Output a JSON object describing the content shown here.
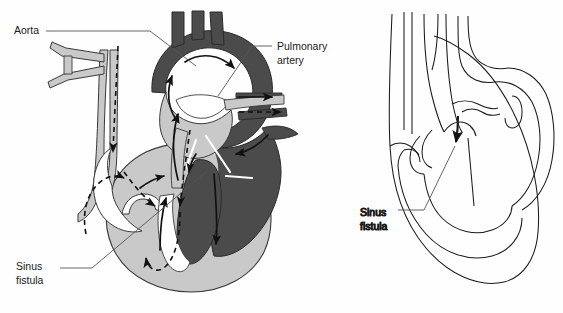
{
  "figure": {
    "panels": [
      {
        "id": "left-panel",
        "name": "shaded-anatomical-heart-diagram",
        "description": "Shaded four-chamber heart with aorta, pulmonary artery and flow arrows showing a sinus fistula shunt"
      },
      {
        "id": "right-panel",
        "name": "line-art-heart-diagram",
        "description": "Outline drawing of the heart with an arrow indicating the sinus fistula"
      }
    ]
  },
  "labels": {
    "aorta": {
      "text": "Aorta",
      "panel": "left-panel",
      "x": 14,
      "y": 34
    },
    "pulmonary_artery": {
      "line1": "Pulmonary",
      "line2": "artery",
      "panel": "left-panel",
      "x": 277,
      "y": 50
    },
    "sinus_fistula_left": {
      "line1": "Sinus",
      "line2": "fistula",
      "panel": "left-panel",
      "x": 16,
      "y": 270
    },
    "sinus_fistula_right": {
      "line1": "Sinus",
      "line2": "fistula",
      "panel": "right-panel",
      "x": 360,
      "y": 212
    }
  },
  "colors": {
    "background": "#fefefe",
    "dark_chamber": "#4b4b4b",
    "light_chamber": "#c9c9c9",
    "mid_vessel": "#b9b9b9",
    "outline": "#1a1a1a",
    "leader_line": "#555555",
    "arrow_solid": "#111111",
    "arrow_dashed": "#111111",
    "white_fill": "#ffffff"
  },
  "flow_arrows": {
    "solid": [
      {
        "name": "aortic-arch-flow",
        "style": "solid"
      },
      {
        "name": "ascending-aorta-flow",
        "style": "solid"
      },
      {
        "name": "pulmonary-artery-outflow",
        "style": "solid"
      },
      {
        "name": "right-atrium-inflow",
        "style": "solid"
      },
      {
        "name": "right-ventricle-inflow",
        "style": "solid"
      },
      {
        "name": "left-ventricle-inflow",
        "style": "solid"
      },
      {
        "name": "fistula-shunt-flow",
        "style": "solid"
      }
    ],
    "dashed": [
      {
        "name": "descending-aorta-flow",
        "style": "dashed"
      },
      {
        "name": "fistula-regurgitant-flow",
        "style": "dashed"
      },
      {
        "name": "pulmonary-artery-shunt-flow",
        "style": "dashed"
      },
      {
        "name": "left-atrium-return-flow",
        "style": "dashed"
      },
      {
        "name": "ventricular-diastolic-flow",
        "style": "dashed"
      }
    ]
  },
  "right_panel_marker": {
    "name": "fistula-pointer-arrow",
    "style": "solid"
  }
}
